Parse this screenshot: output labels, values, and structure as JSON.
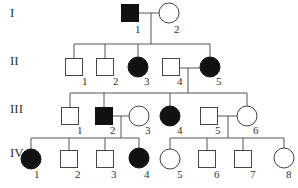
{
  "generations": [
    {
      "label": "I",
      "y": 14
    },
    {
      "label": "II",
      "y": 62
    },
    {
      "label": "III",
      "y": 110
    },
    {
      "label": "IV",
      "y": 154
    }
  ],
  "individuals": [
    {
      "id": "I-1",
      "num": "1",
      "sex": "male",
      "affected": true,
      "x": 130,
      "y": 13,
      "label_x": 138,
      "label_y": 25
    },
    {
      "id": "I-2",
      "num": "2",
      "sex": "female",
      "affected": false,
      "x": 169,
      "y": 13,
      "label_x": 177,
      "label_y": 25
    },
    {
      "id": "II-1",
      "num": "1",
      "sex": "male",
      "affected": false,
      "x": 74,
      "y": 67,
      "label_x": 85,
      "label_y": 77
    },
    {
      "id": "II-2",
      "num": "2",
      "sex": "male",
      "affected": false,
      "x": 105,
      "y": 67,
      "label_x": 116,
      "label_y": 77
    },
    {
      "id": "II-3",
      "num": "3",
      "sex": "female",
      "affected": true,
      "x": 138,
      "y": 67,
      "label_x": 147,
      "label_y": 77
    },
    {
      "id": "II-4",
      "num": "4",
      "sex": "male",
      "affected": false,
      "x": 171,
      "y": 67,
      "label_x": 180,
      "label_y": 77
    },
    {
      "id": "II-5",
      "num": "5",
      "sex": "female",
      "affected": true,
      "x": 210,
      "y": 67,
      "label_x": 219,
      "label_y": 77
    },
    {
      "id": "III-1",
      "num": "1",
      "sex": "male",
      "affected": false,
      "x": 70,
      "y": 116,
      "label_x": 80,
      "label_y": 126
    },
    {
      "id": "III-2",
      "num": "2",
      "sex": "male",
      "affected": true,
      "x": 104,
      "y": 116,
      "label_x": 113,
      "label_y": 126
    },
    {
      "id": "III-3",
      "num": "3",
      "sex": "female",
      "affected": false,
      "x": 139,
      "y": 116,
      "label_x": 148,
      "label_y": 126
    },
    {
      "id": "III-4",
      "num": "4",
      "sex": "female",
      "affected": true,
      "x": 170,
      "y": 116,
      "label_x": 180,
      "label_y": 126
    },
    {
      "id": "III-5",
      "num": "5",
      "sex": "male",
      "affected": false,
      "x": 209,
      "y": 116,
      "label_x": 218,
      "label_y": 126
    },
    {
      "id": "III-6",
      "num": "6",
      "sex": "female",
      "affected": false,
      "x": 247,
      "y": 116,
      "label_x": 256,
      "label_y": 126
    },
    {
      "id": "IV-1",
      "num": "1",
      "sex": "female",
      "affected": true,
      "x": 31,
      "y": 159,
      "label_x": 37,
      "label_y": 170
    },
    {
      "id": "IV-2",
      "num": "2",
      "sex": "male",
      "affected": false,
      "x": 69,
      "y": 159,
      "label_x": 78,
      "label_y": 170
    },
    {
      "id": "IV-3",
      "num": "3",
      "sex": "male",
      "affected": false,
      "x": 105,
      "y": 159,
      "label_x": 114,
      "label_y": 170
    },
    {
      "id": "IV-4",
      "num": "4",
      "sex": "female",
      "affected": true,
      "x": 139,
      "y": 158,
      "label_x": 147,
      "label_y": 170
    },
    {
      "id": "IV-5",
      "num": "5",
      "sex": "female",
      "affected": false,
      "x": 170,
      "y": 159,
      "label_x": 180,
      "label_y": 170
    },
    {
      "id": "IV-6",
      "num": "6",
      "sex": "male",
      "affected": false,
      "x": 207,
      "y": 159,
      "label_x": 217,
      "label_y": 170
    },
    {
      "id": "IV-7",
      "num": "7",
      "sex": "male",
      "affected": false,
      "x": 243,
      "y": 159,
      "label_x": 253,
      "label_y": 170
    },
    {
      "id": "IV-8",
      "num": "8",
      "sex": "female",
      "affected": false,
      "x": 284,
      "y": 158,
      "label_x": 289,
      "label_y": 170
    }
  ],
  "lines": [
    [
      139,
      13,
      159,
      13
    ],
    [
      151,
      13,
      151,
      44
    ],
    [
      74,
      44,
      210,
      44
    ],
    [
      74,
      44,
      74,
      58
    ],
    [
      105,
      44,
      105,
      58
    ],
    [
      138,
      44,
      138,
      57
    ],
    [
      210,
      44,
      210,
      57
    ],
    [
      179,
      68,
      200,
      68
    ],
    [
      188,
      68,
      188,
      93
    ],
    [
      70,
      93,
      247,
      93
    ],
    [
      70,
      93,
      70,
      107
    ],
    [
      104,
      93,
      104,
      107
    ],
    [
      170,
      93,
      170,
      106
    ],
    [
      247,
      93,
      247,
      106
    ],
    [
      113,
      116,
      129,
      116
    ],
    [
      121,
      116,
      121,
      138
    ],
    [
      31,
      138,
      139,
      138
    ],
    [
      31,
      138,
      31,
      149
    ],
    [
      69,
      138,
      69,
      150
    ],
    [
      105,
      138,
      105,
      150
    ],
    [
      139,
      138,
      139,
      148
    ],
    [
      217,
      116,
      237,
      116
    ],
    [
      228,
      116,
      228,
      138
    ],
    [
      170,
      138,
      284,
      138
    ],
    [
      170,
      138,
      170,
      149
    ],
    [
      207,
      138,
      207,
      150
    ],
    [
      243,
      138,
      243,
      150
    ],
    [
      284,
      138,
      284,
      148
    ]
  ],
  "symbol": {
    "square_half": 8.5,
    "circle_r": 10
  }
}
